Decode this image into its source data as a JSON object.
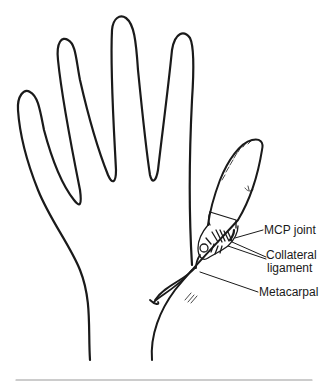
{
  "diagram": {
    "labels": {
      "mcp_joint": "MCP joint",
      "collateral_line1": "Collateral",
      "collateral_line2": "ligament",
      "metacarpal": "Metacarpal"
    },
    "colors": {
      "line": "#1a1a1a",
      "rule": "#9a9a9a",
      "background": "#ffffff"
    }
  }
}
